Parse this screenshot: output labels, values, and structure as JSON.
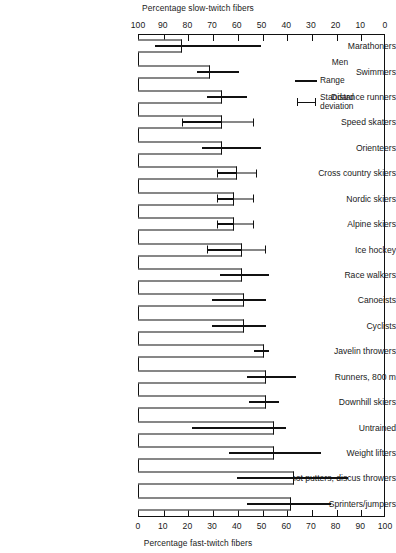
{
  "chart": {
    "top_axis_title": "Percentage slow-twitch fibers",
    "bottom_axis_title": "Percentage fast-twitch fibers"
  },
  "legend": {
    "title": "Men",
    "range_label": "Range",
    "sd_label": "Standard deviation",
    "range_key_icon": "thick-line-icon",
    "sd_key_icon": "error-bar-icon"
  },
  "chart_data": {
    "type": "bar",
    "orientation": "horizontal",
    "title": "",
    "xlabel": "Percentage fast-twitch fibers",
    "ylabel": "",
    "top_xlabel": "Percentage slow-twitch fibers",
    "xlim": [
      0,
      100
    ],
    "grid": false,
    "legend_position": "top-right-inside",
    "top_axis": {
      "label": "Percentage slow-twitch fibers",
      "ticks": [
        100,
        90,
        80,
        70,
        60,
        50,
        40,
        30,
        20,
        10,
        0
      ],
      "direction": "reversed"
    },
    "bottom_axis": {
      "label": "Percentage fast-twitch fibers",
      "ticks": [
        0,
        10,
        20,
        30,
        40,
        50,
        60,
        70,
        80,
        90,
        100
      ],
      "direction": "normal"
    },
    "categories": [
      "Marathoners",
      "Swimmers",
      "Distance runners",
      "Speed skaters",
      "Orienteers",
      "Cross country skiers",
      "Nordic skiers",
      "Alpine skiers",
      "Ice hockey",
      "Race walkers",
      "Canoeists",
      "Cyclists",
      "Javelin throwers",
      "Runners, 800 m",
      "Downhill skiers",
      "Untrained",
      "Weight lifters",
      "Shot putters, discus throwers",
      "Sprinters/jumpers"
    ],
    "series": [
      {
        "name": "Mean percentage fast-twitch fibers",
        "unit": "%",
        "values": [
          18,
          29,
          34,
          34,
          34,
          40,
          39,
          39,
          42,
          42,
          43,
          43,
          51,
          52,
          52,
          55,
          55,
          63,
          62
        ]
      },
      {
        "name": "Range",
        "unit": "%",
        "low": [
          7,
          24,
          28,
          18,
          26,
          32,
          32,
          32,
          28,
          33,
          30,
          30,
          47,
          44,
          45,
          22,
          37,
          40,
          44
        ],
        "high": [
          50,
          41,
          44,
          34,
          50,
          40,
          39,
          39,
          42,
          53,
          52,
          52,
          53,
          64,
          57,
          60,
          74,
          85,
          78
        ]
      },
      {
        "name": "Standard deviation",
        "unit": "%",
        "low": [
          null,
          null,
          null,
          18,
          null,
          32,
          32,
          32,
          28,
          null,
          null,
          null,
          null,
          null,
          null,
          null,
          null,
          null,
          null
        ],
        "high": [
          null,
          null,
          null,
          47,
          null,
          48,
          47,
          47,
          52,
          null,
          null,
          null,
          null,
          null,
          null,
          null,
          null,
          null,
          null
        ]
      }
    ]
  }
}
